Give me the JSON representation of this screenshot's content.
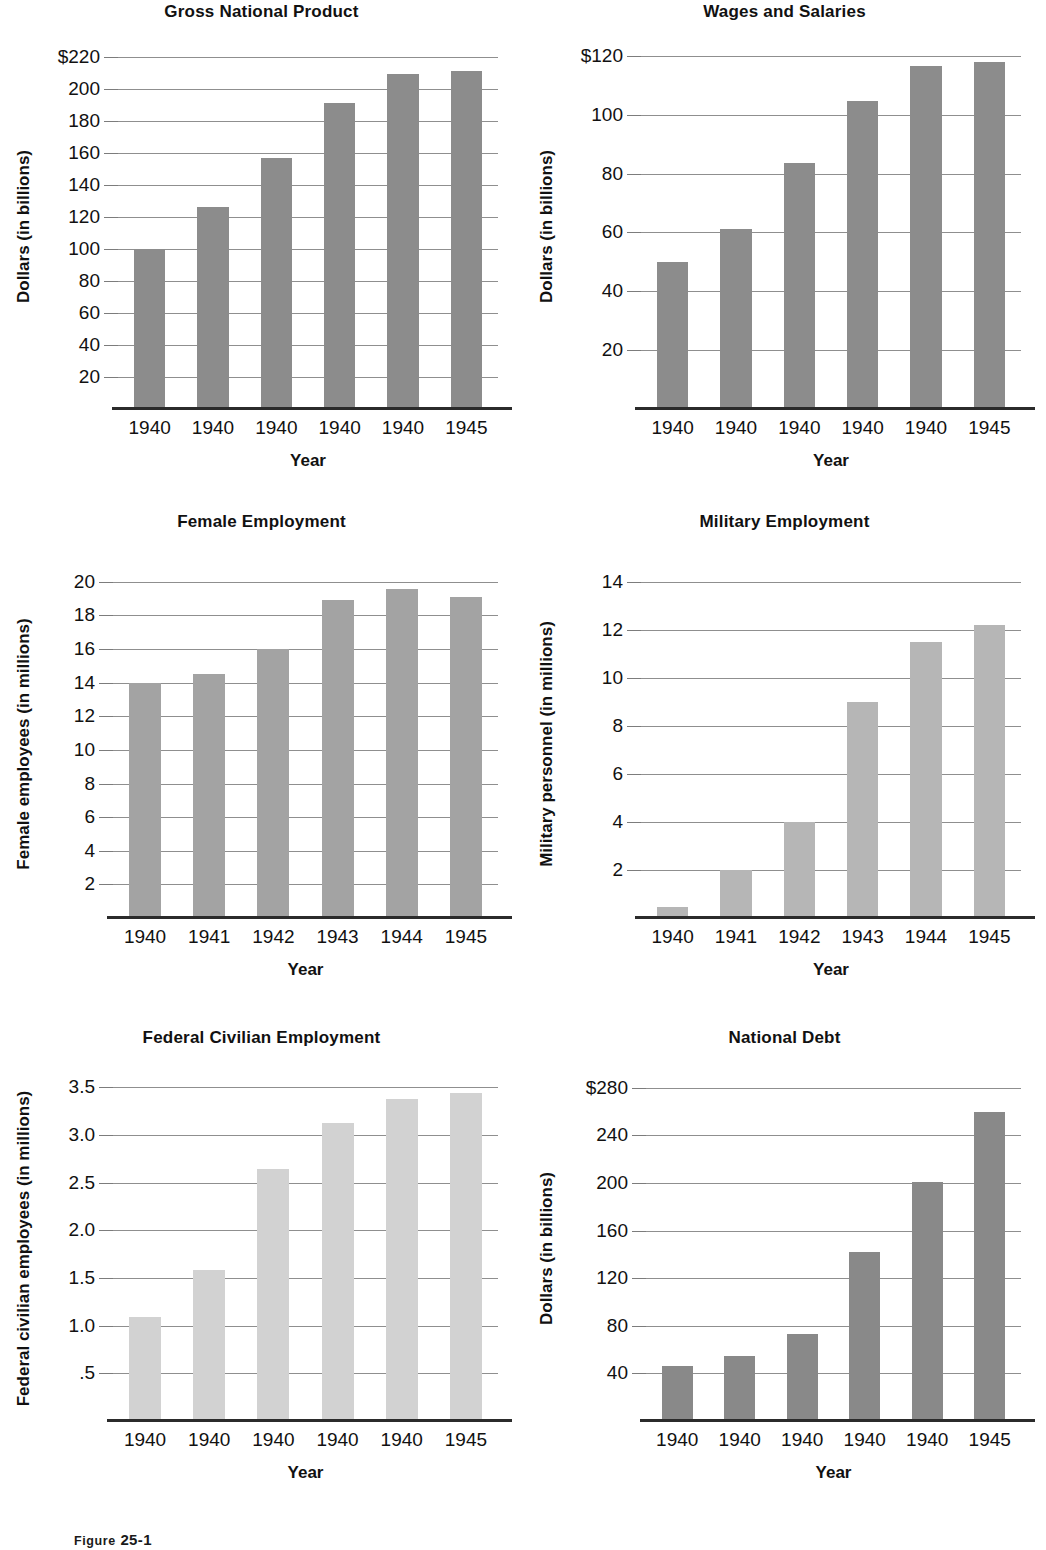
{
  "figure": {
    "caption_label": "Figure",
    "caption_number": "25-1"
  },
  "charts": [
    {
      "id": "gross-national-product",
      "title": "Gross National Product",
      "xlabel": "Year",
      "ylabel": "Dollars (in billions)",
      "ytick_labels": [
        "20",
        "40",
        "60",
        "80",
        "100",
        "120",
        "140",
        "160",
        "180",
        "200",
        "$220"
      ],
      "ytick_values": [
        20,
        40,
        60,
        80,
        100,
        120,
        140,
        160,
        180,
        200,
        220
      ],
      "categories": [
        "1940",
        "1940",
        "1940",
        "1940",
        "1940",
        "1945"
      ],
      "values": [
        100,
        126,
        157,
        191,
        209,
        211
      ],
      "ymin": 0,
      "ymax": 228,
      "bar_color": "#8c8c8c"
    },
    {
      "id": "wages-and-salaries",
      "title": "Wages and Salaries",
      "xlabel": "Year",
      "ylabel": "Dollars (in billions)",
      "ytick_labels": [
        "20",
        "40",
        "60",
        "80",
        "100",
        "$120"
      ],
      "ytick_values": [
        20,
        40,
        60,
        80,
        100,
        120
      ],
      "categories": [
        "1940",
        "1940",
        "1940",
        "1940",
        "1940",
        "1945"
      ],
      "values": [
        50,
        61,
        83.5,
        104.5,
        116.5,
        118
      ],
      "ymin": 0,
      "ymax": 124,
      "bar_color": "#8c8c8c"
    },
    {
      "id": "female-employment",
      "title": "Female Employment",
      "xlabel": "Year",
      "ylabel": "Female employees (in millions)",
      "ytick_labels": [
        "2",
        "4",
        "6",
        "8",
        "10",
        "12",
        "14",
        "16",
        "18",
        "20"
      ],
      "ytick_values": [
        2,
        4,
        6,
        8,
        10,
        12,
        14,
        16,
        18,
        20
      ],
      "categories": [
        "1940",
        "1941",
        "1942",
        "1943",
        "1944",
        "1945"
      ],
      "values": [
        14.0,
        14.5,
        16.0,
        18.9,
        19.6,
        19.1
      ],
      "ymin": 0,
      "ymax": 20.7,
      "bar_color": "#a3a3a3"
    },
    {
      "id": "military-employment",
      "title": "Military Employment",
      "xlabel": "Year",
      "ylabel": "Military personnel (in millions)",
      "ytick_labels": [
        "2",
        "4",
        "6",
        "8",
        "10",
        "12",
        "14"
      ],
      "ytick_values": [
        2,
        4,
        6,
        8,
        10,
        12,
        14
      ],
      "categories": [
        "1940",
        "1941",
        "1942",
        "1943",
        "1944",
        "1945"
      ],
      "values": [
        0.46,
        2.0,
        4.0,
        9.0,
        11.5,
        12.2
      ],
      "ymin": 0,
      "ymax": 14.5,
      "bar_color": "#b6b6b6"
    },
    {
      "id": "federal-civilian-employment",
      "title": "Federal Civilian Employment",
      "xlabel": "Year",
      "ylabel": "Federal civilian employees (in millions)",
      "ytick_labels": [
        ".5",
        "1.0",
        "1.5",
        "2.0",
        "2.5",
        "3.0",
        "3.5"
      ],
      "ytick_values": [
        0.5,
        1.0,
        1.5,
        2.0,
        2.5,
        3.0,
        3.5
      ],
      "categories": [
        "1940",
        "1940",
        "1940",
        "1940",
        "1940",
        "1945"
      ],
      "values": [
        1.09,
        1.58,
        2.64,
        3.13,
        3.38,
        3.44
      ],
      "ymin": 0,
      "ymax": 3.62,
      "bar_color": "#d2d2d2"
    },
    {
      "id": "national-debt",
      "title": "National Debt",
      "xlabel": "Year",
      "ylabel": "Dollars (in billions)",
      "ytick_labels": [
        "40",
        "80",
        "120",
        "160",
        "200",
        "240",
        "$280"
      ],
      "ytick_values": [
        40,
        80,
        120,
        160,
        200,
        240,
        280
      ],
      "categories": [
        "1940",
        "1940",
        "1940",
        "1940",
        "1940",
        "1945"
      ],
      "values": [
        46,
        55,
        73,
        142,
        201,
        260
      ],
      "ymin": 0,
      "ymax": 290,
      "bar_color": "#898989"
    }
  ],
  "chart_data": [
    {
      "type": "bar",
      "title": "Gross National Product",
      "xlabel": "Year",
      "ylabel": "Dollars (in billions)",
      "categories": [
        "1940",
        "1940",
        "1940",
        "1940",
        "1940",
        "1945"
      ],
      "values": [
        100,
        126,
        157,
        191,
        209,
        211
      ],
      "ylim": [
        0,
        228
      ],
      "yticks": [
        20,
        40,
        60,
        80,
        100,
        120,
        140,
        160,
        180,
        200,
        220
      ],
      "grid": true,
      "legend": "none"
    },
    {
      "type": "bar",
      "title": "Wages and Salaries",
      "xlabel": "Year",
      "ylabel": "Dollars (in billions)",
      "categories": [
        "1940",
        "1940",
        "1940",
        "1940",
        "1940",
        "1945"
      ],
      "values": [
        50,
        61,
        83.5,
        104.5,
        116.5,
        118
      ],
      "ylim": [
        0,
        124
      ],
      "yticks": [
        20,
        40,
        60,
        80,
        100,
        120
      ],
      "grid": true,
      "legend": "none"
    },
    {
      "type": "bar",
      "title": "Female Employment",
      "xlabel": "Year",
      "ylabel": "Female employees (in millions)",
      "categories": [
        "1940",
        "1941",
        "1942",
        "1943",
        "1944",
        "1945"
      ],
      "values": [
        14.0,
        14.5,
        16.0,
        18.9,
        19.6,
        19.1
      ],
      "ylim": [
        0,
        20.7
      ],
      "yticks": [
        2,
        4,
        6,
        8,
        10,
        12,
        14,
        16,
        18,
        20
      ],
      "grid": true,
      "legend": "none"
    },
    {
      "type": "bar",
      "title": "Military Employment",
      "xlabel": "Year",
      "ylabel": "Military personnel (in millions)",
      "categories": [
        "1940",
        "1941",
        "1942",
        "1943",
        "1944",
        "1945"
      ],
      "values": [
        0.46,
        2.0,
        4.0,
        9.0,
        11.5,
        12.2
      ],
      "ylim": [
        0,
        14.5
      ],
      "yticks": [
        2,
        4,
        6,
        8,
        10,
        12,
        14
      ],
      "grid": true,
      "legend": "none"
    },
    {
      "type": "bar",
      "title": "Federal Civilian Employment",
      "xlabel": "Year",
      "ylabel": "Federal civilian employees (in millions)",
      "categories": [
        "1940",
        "1940",
        "1940",
        "1940",
        "1940",
        "1945"
      ],
      "values": [
        1.09,
        1.58,
        2.64,
        3.13,
        3.38,
        3.44
      ],
      "ylim": [
        0,
        3.62
      ],
      "yticks": [
        0.5,
        1.0,
        1.5,
        2.0,
        2.5,
        3.0,
        3.5
      ],
      "grid": true,
      "legend": "none"
    },
    {
      "type": "bar",
      "title": "National Debt",
      "xlabel": "Year",
      "ylabel": "Dollars (in billions)",
      "categories": [
        "1940",
        "1940",
        "1940",
        "1940",
        "1940",
        "1945"
      ],
      "values": [
        46,
        55,
        73,
        142,
        201,
        260
      ],
      "ylim": [
        0,
        290
      ],
      "yticks": [
        40,
        80,
        120,
        160,
        200,
        240,
        280
      ],
      "grid": true,
      "legend": "none"
    }
  ]
}
